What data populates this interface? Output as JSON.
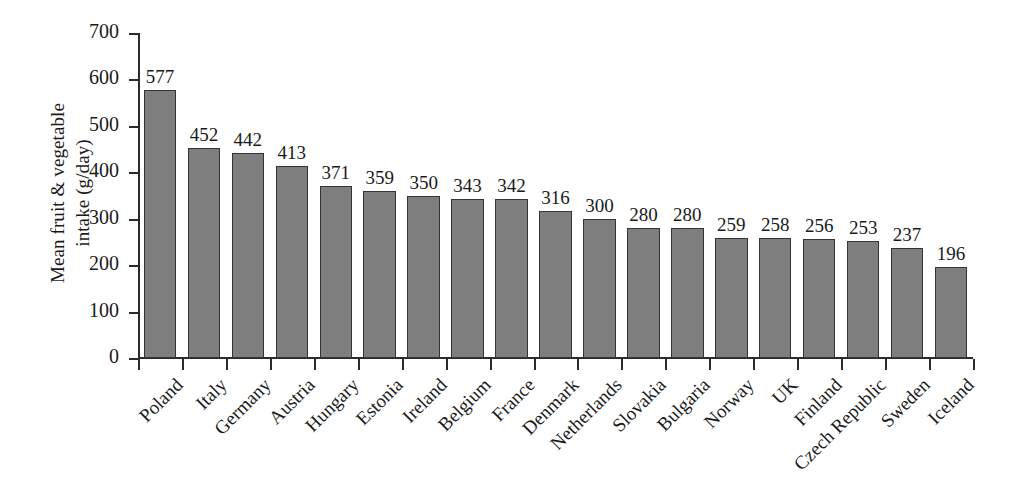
{
  "chart_data": {
    "type": "bar",
    "title": "",
    "xlabel": "",
    "ylabel": "Mean fruit & vegetable intake (g/day)",
    "ylabel_line1": "Mean fruit & vegetable",
    "ylabel_line2": "intake (g/day)",
    "ylim": [
      0,
      700
    ],
    "ytick_values": [
      0,
      100,
      200,
      300,
      400,
      500,
      600,
      700
    ],
    "ytick_labels": [
      "0",
      "100",
      "200",
      "300",
      "400",
      "500",
      "600",
      "700"
    ],
    "grid": false,
    "legend": false,
    "bar_color": "#7e7e7e",
    "bar_edge_color": "#343434",
    "axis_color": "#2b2b2b",
    "background_color": "#ffffff",
    "value_labels_shown": true,
    "categories": [
      "Poland",
      "Italy",
      "Germany",
      "Austria",
      "Hungary",
      "Estonia",
      "Ireland",
      "Belgium",
      "France",
      "Denmark",
      "Netherlands",
      "Slovakia",
      "Bulgaria",
      "Norway",
      "UK",
      "Finland",
      "Czech Republic",
      "Sweden",
      "Iceland"
    ],
    "values": [
      577,
      452,
      442,
      413,
      371,
      359,
      350,
      343,
      342,
      316,
      300,
      280,
      280,
      259,
      258,
      256,
      253,
      237,
      196
    ],
    "value_label_texts": [
      "577",
      "452",
      "442",
      "413",
      "371",
      "359",
      "350",
      "343",
      "342",
      "316",
      "300",
      "280",
      "280",
      "259",
      "258",
      "256",
      "253",
      "237",
      "196"
    ]
  }
}
